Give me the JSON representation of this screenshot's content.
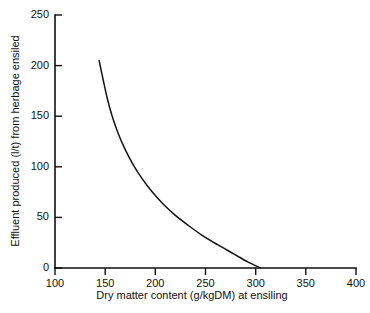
{
  "chart_data": {
    "type": "line",
    "title": "",
    "xlabel": "Dry matter content (g/kgDM) at ensiling",
    "ylabel": "Effluent produced (l/t) from herbage ensiled",
    "xlim": [
      100,
      400
    ],
    "ylim": [
      0,
      250
    ],
    "xticks": [
      100,
      150,
      200,
      250,
      300,
      350,
      400
    ],
    "yticks": [
      0,
      50,
      100,
      150,
      200,
      250
    ],
    "xtick_labels": [
      "100",
      "150",
      "200",
      "250",
      "300",
      "350",
      "400"
    ],
    "ytick_labels": [
      "0",
      "50",
      "100",
      "150",
      "200",
      "250"
    ],
    "grid": false,
    "legend": false,
    "series": [
      {
        "name": "Effluent produced",
        "x": [
          144,
          148,
          152,
          157,
          163,
          170,
          178,
          187,
          197,
          208,
          220,
          233,
          247,
          262,
          278,
          292,
          305
        ],
        "y": [
          205,
          186,
          168,
          150,
          133,
          117,
          102,
          88,
          75,
          63,
          52,
          42,
          32,
          23,
          14,
          6,
          0
        ]
      }
    ]
  }
}
